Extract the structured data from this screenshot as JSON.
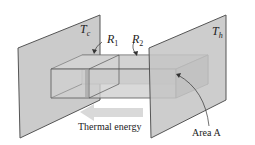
{
  "diagram": {
    "labels": {
      "cold_plate": {
        "symbol": "T",
        "subscript": "c"
      },
      "hot_plate": {
        "symbol": "T",
        "subscript": "h"
      },
      "resistance_1": {
        "symbol": "R",
        "subscript": "1"
      },
      "resistance_2": {
        "symbol": "R",
        "subscript": "2"
      },
      "arrow_label": "Thermal energy",
      "area_label": "Area A"
    },
    "colors": {
      "plate_fill": "#c8c8c8",
      "plate_edge": "#555555",
      "box_fill": "#bdbdbd",
      "arrow_fill": "#d9d9d9"
    }
  }
}
